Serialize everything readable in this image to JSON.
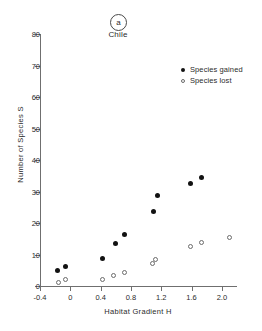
{
  "figure": {
    "panel_tag": "a",
    "region_name": "Chile"
  },
  "legend": {
    "position": "top-right",
    "entries": [
      {
        "label": "Species gained",
        "marker": "filled-circle"
      },
      {
        "label": "Species lost",
        "marker": "open-circle"
      }
    ]
  },
  "chart_data": {
    "type": "scatter",
    "title": "Chile",
    "xlabel": "Habitat Gradient H",
    "ylabel": "Number of Species S",
    "xlim": [
      -0.4,
      2.2
    ],
    "ylim": [
      0,
      80
    ],
    "grid": false,
    "xticks": [
      -0.4,
      0,
      0.4,
      0.8,
      1.2,
      1.6,
      2.0
    ],
    "xtick_labels": [
      "-0.4",
      "0",
      "0.4",
      "0.8",
      "1.2",
      "1.6",
      "2.0"
    ],
    "yticks": [
      0,
      10,
      20,
      30,
      40,
      50,
      60,
      70,
      80
    ],
    "ytick_labels": [
      "0",
      "10",
      "20",
      "30",
      "40",
      "50",
      "60",
      "70",
      "80"
    ],
    "series": [
      {
        "name": "Species gained",
        "marker": "filled-circle",
        "color": "#121212",
        "points": [
          {
            "x": -0.17,
            "y": 5.0
          },
          {
            "x": -0.07,
            "y": 6.2
          },
          {
            "x": 0.43,
            "y": 8.8
          },
          {
            "x": 0.6,
            "y": 13.4
          },
          {
            "x": 0.71,
            "y": 16.4
          },
          {
            "x": 1.1,
            "y": 23.5
          },
          {
            "x": 1.15,
            "y": 28.8
          },
          {
            "x": 1.58,
            "y": 32.4
          },
          {
            "x": 1.73,
            "y": 34.4
          }
        ]
      },
      {
        "name": "Species lost",
        "marker": "open-circle",
        "color": "#6b6b6b",
        "points": [
          {
            "x": -0.15,
            "y": 1.0
          },
          {
            "x": -0.06,
            "y": 2.0
          },
          {
            "x": 0.43,
            "y": 2.2
          },
          {
            "x": 0.57,
            "y": 3.2
          },
          {
            "x": 0.71,
            "y": 4.2
          },
          {
            "x": 1.08,
            "y": 7.0
          },
          {
            "x": 1.12,
            "y": 8.5
          },
          {
            "x": 1.59,
            "y": 12.5
          },
          {
            "x": 1.73,
            "y": 13.8
          },
          {
            "x": 2.1,
            "y": 15.3
          }
        ]
      }
    ]
  }
}
